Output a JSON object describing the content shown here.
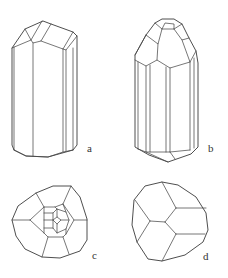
{
  "figure": {
    "line_color": "#4a4a4a",
    "background": "#ffffff",
    "panels": [
      {
        "id": "a",
        "label": "a",
        "view": "prismatic crystal, side view, truncated termination"
      },
      {
        "id": "b",
        "label": "b",
        "view": "prismatic crystal, side view, pointed multi-faceted termination"
      },
      {
        "id": "c",
        "label": "c",
        "view": "end-on view, complex faceted termination"
      },
      {
        "id": "d",
        "label": "d",
        "view": "end-on view, simple three-face termination"
      }
    ]
  }
}
